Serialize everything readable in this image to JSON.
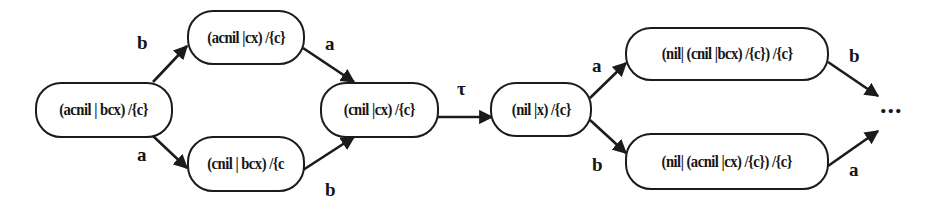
{
  "diagram": {
    "type": "labeled transition system",
    "nodes": [
      {
        "id": "n1",
        "label": "(acnil | bcx) /{c}"
      },
      {
        "id": "n2",
        "label": "(acnil |cx) /{c}"
      },
      {
        "id": "n3",
        "label": "(cnil | bcx) /{c"
      },
      {
        "id": "n4",
        "label": "(cnil |cx) /{c}"
      },
      {
        "id": "n5",
        "label": "(nil |x) /{c}"
      },
      {
        "id": "n6",
        "label": "(nil| (cnil |bcx) /{c}) /{c}"
      },
      {
        "id": "n7",
        "label": "(nil| (acnil |cx) /{c}) /{c}"
      }
    ],
    "edges": [
      {
        "from": "n1",
        "to": "n2",
        "label": "b"
      },
      {
        "from": "n1",
        "to": "n3",
        "label": "a"
      },
      {
        "from": "n2",
        "to": "n4",
        "label": "a"
      },
      {
        "from": "n3",
        "to": "n4",
        "label": "b"
      },
      {
        "from": "n4",
        "to": "n5",
        "label": "τ"
      },
      {
        "from": "n5",
        "to": "n6",
        "label": "a"
      },
      {
        "from": "n5",
        "to": "n7",
        "label": "b"
      },
      {
        "from": "n6",
        "to": "continuation",
        "label": "b"
      },
      {
        "from": "n7",
        "to": "continuation",
        "label": "a"
      }
    ],
    "continuation": "...",
    "colors": {
      "stroke": "#1b1b1b",
      "background": "#ffffff"
    }
  }
}
